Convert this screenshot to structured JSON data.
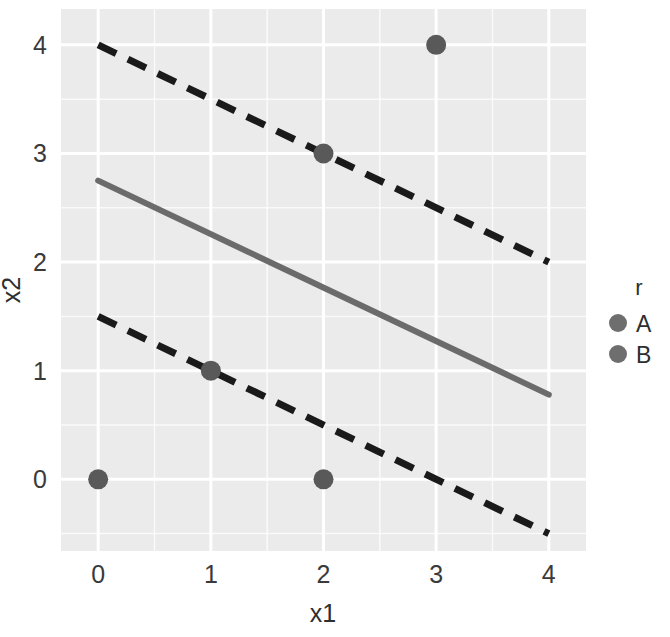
{
  "chart_data": {
    "type": "scatter",
    "title": "",
    "subtitle": "",
    "xlabel": "x1",
    "ylabel": "x2",
    "xlim": [
      -0.33,
      4.33
    ],
    "ylim": [
      -0.66,
      4.33
    ],
    "xticks": [
      "0",
      "1",
      "2",
      "3",
      "4"
    ],
    "xtick_values": [
      0,
      1,
      2,
      3,
      4
    ],
    "yticks": [
      "0",
      "1",
      "2",
      "3",
      "4"
    ],
    "ytick_values": [
      0,
      1,
      2,
      3,
      4
    ],
    "grid": true,
    "grid_color": "#ffffff",
    "panel_background": "#ebebeb",
    "legend": {
      "title": "r",
      "position": "right",
      "entries": [
        {
          "label": "A",
          "color": "#6e6e6e",
          "marker": "circle"
        },
        {
          "label": "B",
          "color": "#6e6e6e",
          "marker": "circle"
        }
      ]
    },
    "series": [
      {
        "name": "A",
        "color": "#595959",
        "marker": "circle",
        "points": [
          {
            "x": 0,
            "y": 0
          },
          {
            "x": 1,
            "y": 1
          },
          {
            "x": 2,
            "y": 0
          }
        ]
      },
      {
        "name": "B",
        "color": "#595959",
        "marker": "circle",
        "points": [
          {
            "x": 2,
            "y": 3
          },
          {
            "x": 3,
            "y": 4
          }
        ]
      }
    ],
    "lines": [
      {
        "name": "decision-boundary",
        "style": "solid",
        "color": "#6b6b6b",
        "width": 6,
        "from": {
          "x": 0,
          "y": 2.75
        },
        "to": {
          "x": 4,
          "y": 0.78
        }
      },
      {
        "name": "upper-margin",
        "style": "dashed",
        "color": "#1a1a1a",
        "width": 7,
        "from": {
          "x": 0,
          "y": 4.0
        },
        "to": {
          "x": 4,
          "y": 2.0
        }
      },
      {
        "name": "lower-margin",
        "style": "dashed",
        "color": "#1a1a1a",
        "width": 7,
        "from": {
          "x": 0,
          "y": 1.5
        },
        "to": {
          "x": 4,
          "y": -0.5
        }
      }
    ]
  },
  "axis": {
    "x_title": "x1",
    "y_title": "x2",
    "x_tick_0": "0",
    "x_tick_1": "1",
    "x_tick_2": "2",
    "x_tick_3": "3",
    "x_tick_4": "4",
    "y_tick_0": "0",
    "y_tick_1": "1",
    "y_tick_2": "2",
    "y_tick_3": "3",
    "y_tick_4": "4"
  },
  "legend": {
    "title": "r",
    "item_a": "A",
    "item_b": "B"
  }
}
